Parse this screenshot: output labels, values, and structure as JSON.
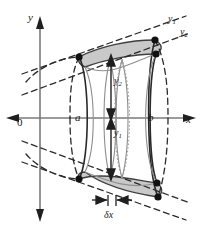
{
  "figure": {
    "axes": {
      "y_label": "y",
      "x_label": "x",
      "origin_label": "0",
      "x_axis_y": 118,
      "y_axis_x": 40
    },
    "labels": {
      "lower_limit": "a",
      "upper_limit": "b",
      "outer_curve": "y",
      "outer_curve_sub": "1",
      "inner_curve": "y",
      "inner_curve_sub": "2",
      "radius_outer": "y",
      "radius_outer_sub": "2",
      "radius_inner": "y",
      "radius_inner_sub": "1",
      "thickness": "δx"
    },
    "colors": {
      "stroke": "#1a1a1a",
      "axis": "#777777",
      "shade_fill": "#c9c9c9",
      "shade_stroke": "#4a4a4a",
      "light_stroke": "#8e8e8e",
      "dot": "#111111",
      "background": "#ffffff"
    },
    "geometry": {
      "a_x": 79,
      "b_x": 157,
      "shell_left_x": 110,
      "shell_right_x": 122,
      "ellipse_rx_a": 9,
      "ellipse_ry_a": 60,
      "ellipse_rx_b": 11,
      "ellipse_ry_b": 76,
      "y2_top": 58,
      "y1_bottom": 178
    },
    "points": [
      {
        "name": "left-top-vertex",
        "x": 79,
        "y": 57
      },
      {
        "name": "left-bottom-vertex",
        "x": 79,
        "y": 179
      },
      {
        "name": "right-top-outer",
        "x": 155,
        "y": 40
      },
      {
        "name": "right-top-inner",
        "x": 156,
        "y": 54
      },
      {
        "name": "right-bottom-inner",
        "x": 157,
        "y": 183
      },
      {
        "name": "right-bottom-outer",
        "x": 158,
        "y": 197
      }
    ]
  }
}
